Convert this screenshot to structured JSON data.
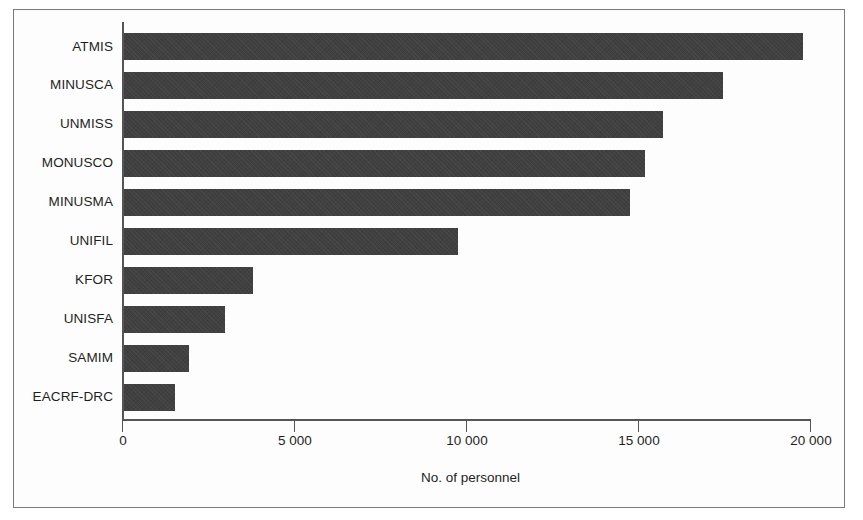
{
  "chart_data": {
    "type": "bar",
    "orientation": "horizontal",
    "title": "",
    "subtitle": "",
    "xlabel": "No. of personnel",
    "ylabel": "",
    "categories": [
      "ATMIS",
      "MINUSCA",
      "UNMISS",
      "MONUSCO",
      "MINUSMA",
      "UNIFIL",
      "KFOR",
      "UNISFA",
      "SAMIM",
      "EACRF-DRC"
    ],
    "values": [
      19800,
      17450,
      15700,
      15200,
      14750,
      9750,
      3750,
      2950,
      1900,
      1480
    ],
    "xlim": [
      0,
      20000
    ],
    "ylim": [
      0,
      10
    ],
    "xticks": [
      0,
      5000,
      10000,
      15000,
      20000
    ],
    "xtick_labels": [
      "0",
      "5 000",
      "10 000",
      "15 000",
      "20 000"
    ],
    "grid": false,
    "legend": null,
    "bar_color": "#404040",
    "annotations": []
  },
  "axis": {
    "x_title": "No. of personnel"
  },
  "colors": {
    "bar": "#404040",
    "axis": "#555555",
    "frame": "#7a7a7a",
    "text": "#1f1f1f",
    "background": "#ffffff"
  }
}
